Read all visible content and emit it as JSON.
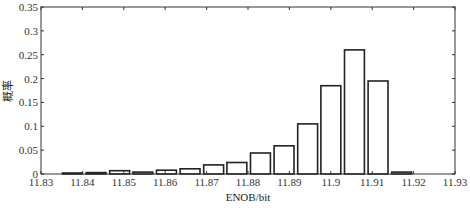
{
  "chart_data": {
    "type": "bar",
    "title": "",
    "xlabel": "ENOB/bit",
    "ylabel": "概率",
    "xlim": [
      11.83,
      11.93
    ],
    "ylim": [
      0,
      0.35
    ],
    "xticks": [
      "11.83",
      "11.84",
      "11.85",
      "11.86",
      "11.87",
      "11.88",
      "11.89",
      "11.9",
      "11.91",
      "11.92",
      "11.93"
    ],
    "yticks": [
      "0",
      "0.05",
      "0.1",
      "0.15",
      "0.2",
      "0.25",
      "0.3",
      "0.35"
    ],
    "grid": false,
    "legend": null,
    "bar_width": 0.0048,
    "x": [
      11.8376,
      11.8433,
      11.849,
      11.8546,
      11.8603,
      11.866,
      11.8717,
      11.8773,
      11.883,
      11.8887,
      11.8944,
      11.9,
      11.9057,
      11.9114,
      11.9171
    ],
    "values": [
      0.002,
      0.003,
      0.007,
      0.004,
      0.008,
      0.011,
      0.019,
      0.024,
      0.044,
      0.059,
      0.105,
      0.185,
      0.26,
      0.195,
      0.004
    ]
  }
}
